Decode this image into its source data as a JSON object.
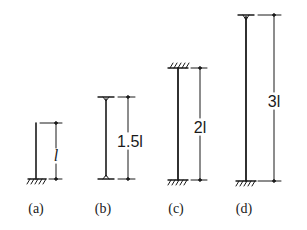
{
  "figure": {
    "columns": [
      {
        "id": "a",
        "caption": "(a)",
        "length_label": "l",
        "length_multiplier": 1,
        "top_support": "free",
        "bottom_support": "fixed",
        "geometry": {
          "x": 36,
          "top": 123,
          "bottom": 179,
          "dim_x": 56,
          "label_x": 56,
          "label_y": 156,
          "caption_x": 36
        }
      },
      {
        "id": "b",
        "caption": "(b)",
        "length_label": "1.5l",
        "length_multiplier": 1.5,
        "top_support": "pinned",
        "bottom_support": "pinned",
        "geometry": {
          "x": 106,
          "top": 97,
          "bottom": 179,
          "dim_x": 128,
          "label_x": 130,
          "label_y": 144,
          "caption_x": 103
        }
      },
      {
        "id": "c",
        "caption": "(c)",
        "length_label": "2l",
        "length_multiplier": 2,
        "top_support": "fixed",
        "bottom_support": "fixed",
        "geometry": {
          "x": 178,
          "top": 68,
          "bottom": 180,
          "dim_x": 200,
          "label_x": 200,
          "label_y": 130,
          "caption_x": 176
        }
      },
      {
        "id": "d",
        "caption": "(d)",
        "length_label": "3l",
        "length_multiplier": 3,
        "top_support": "pinned",
        "bottom_support": "fixed",
        "geometry": {
          "x": 246,
          "top": 15,
          "bottom": 181,
          "dim_x": 274,
          "label_x": 274,
          "label_y": 104,
          "caption_x": 244
        }
      }
    ],
    "caption_y": 213,
    "colors": {
      "line": "#1a1a1a",
      "background": "#ffffff"
    }
  }
}
